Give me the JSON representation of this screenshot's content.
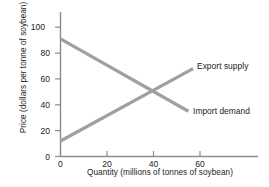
{
  "chart_data": {
    "type": "line",
    "title": "",
    "xlabel": "Quantity (millions of tonnes of soybean)",
    "ylabel": "Price (dollars per tonne of soybean)",
    "xlim": [
      0,
      85
    ],
    "ylim": [
      0,
      108
    ],
    "xticks": [
      0,
      20,
      40,
      60
    ],
    "yticks": [
      0,
      20,
      40,
      60,
      80,
      100
    ],
    "grid": false,
    "legend_position": "inline-right",
    "line_color": "#a0a0a0",
    "axis_color": "#8c8c8c",
    "text_color": "#1c1c1c",
    "series": [
      {
        "name": "Export supply",
        "points": [
          {
            "x": 0,
            "y": 12
          },
          {
            "x": 57,
            "y": 68
          }
        ],
        "label_text": "Export supply"
      },
      {
        "name": "Import demand",
        "points": [
          {
            "x": 0,
            "y": 91
          },
          {
            "x": 55,
            "y": 35
          }
        ],
        "label_text": "Import demand"
      }
    ],
    "intersection": {
      "x": 40,
      "y": 50
    },
    "tick_labels_y": [
      "0",
      "20",
      "40",
      "60",
      "80",
      "100"
    ],
    "tick_labels_x": [
      "0",
      "20",
      "40",
      "60"
    ],
    "legend_entries": [
      "Export supply",
      "Import demand"
    ]
  }
}
